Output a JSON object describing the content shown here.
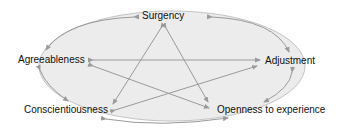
{
  "diagram": {
    "type": "five-factor-circumplex",
    "colors": {
      "ellipse_fill": "#ececec",
      "ellipse_stroke": "#bdbdbd",
      "arrow": "#9a9a9a",
      "text": "#111111"
    },
    "nodes": [
      {
        "id": "surgency",
        "label": "Surgency"
      },
      {
        "id": "agreeableness",
        "label": "Agreeableness"
      },
      {
        "id": "adjustment",
        "label": "Adjustment"
      },
      {
        "id": "conscientiousness",
        "label": "Conscientiousness"
      },
      {
        "id": "openness",
        "label": "Openness to experience"
      }
    ],
    "edges_outer": [
      {
        "from": "surgency",
        "to": "agreeableness"
      },
      {
        "from": "surgency",
        "to": "adjustment"
      },
      {
        "from": "agreeableness",
        "to": "conscientiousness"
      },
      {
        "from": "adjustment",
        "to": "openness"
      },
      {
        "from": "conscientiousness",
        "to": "openness"
      }
    ],
    "edges_inner": [
      {
        "from": "surgency",
        "to": "conscientiousness"
      },
      {
        "from": "surgency",
        "to": "openness"
      },
      {
        "from": "agreeableness",
        "to": "adjustment"
      },
      {
        "from": "agreeableness",
        "to": "openness"
      },
      {
        "from": "conscientiousness",
        "to": "adjustment"
      }
    ]
  }
}
